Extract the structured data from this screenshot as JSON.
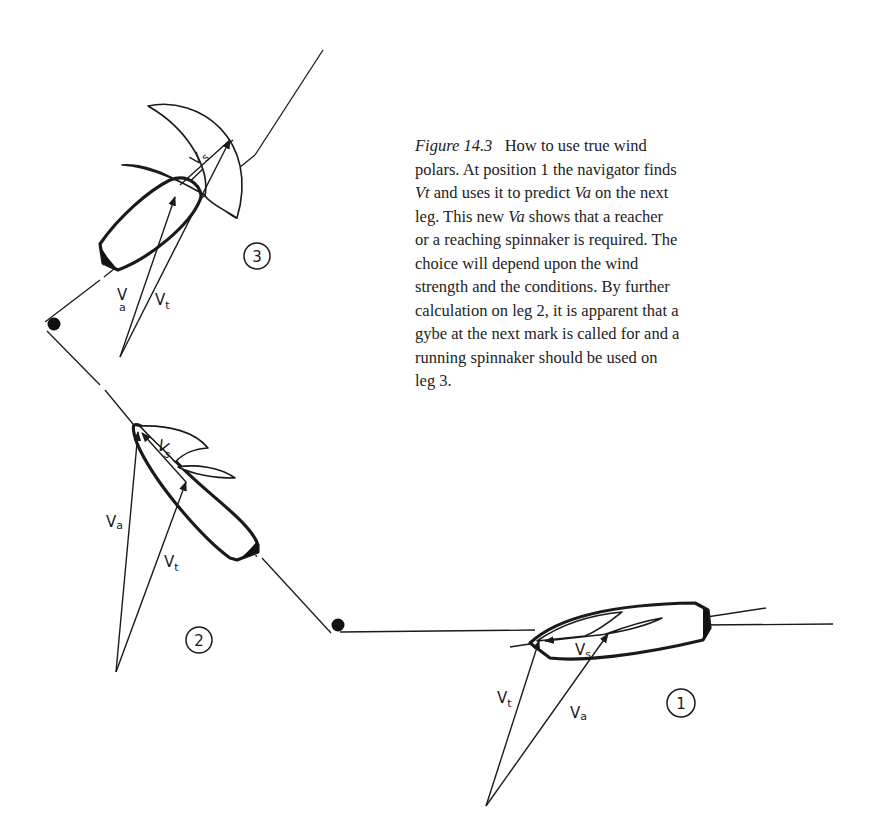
{
  "caption": {
    "figure_label": "Figure  14.3",
    "lines": [
      {
        "pre": "",
        "title_part": "How to use true wind"
      },
      {
        "text": "polars. At position 1 the navigator finds"
      },
      {
        "italic_start": "Vt",
        "rest": " and uses it to predict ",
        "italic_mid": "Va",
        "end": " on the next"
      },
      {
        "start": "leg. This new ",
        "italic_mid": "Va",
        "end": " shows that a reacher"
      },
      {
        "text": "or a reaching spinnaker is required. The"
      },
      {
        "text": "choice will depend upon the wind"
      },
      {
        "text": "strength and the conditions. By further"
      },
      {
        "text": "calculation on leg 2, it is apparent that a"
      },
      {
        "text": "gybe at the next mark is called for and a"
      },
      {
        "text": "running spinnaker should be used on"
      },
      {
        "text": "leg 3."
      }
    ]
  },
  "diagram": {
    "positions": [
      {
        "id": "1",
        "label": "1",
        "vectors": {
          "true_wind": {
            "main": "V",
            "sub": "t"
          },
          "apparent_wind": {
            "main": "V",
            "sub": "a"
          },
          "boat_speed": {
            "main": "V",
            "sub": "s"
          }
        }
      },
      {
        "id": "2",
        "label": "2",
        "vectors": {
          "true_wind": {
            "main": "V",
            "sub": "t"
          },
          "apparent_wind": {
            "main": "V",
            "sub": "a"
          },
          "boat_speed": {
            "main": "V",
            "sub": "s"
          }
        }
      },
      {
        "id": "3",
        "label": "3",
        "vectors": {
          "true_wind": {
            "main": "V",
            "sub": "t"
          },
          "apparent_wind": {
            "main": "V",
            "sub": "a"
          },
          "boat_speed": {
            "main": "V",
            "sub": "s"
          }
        }
      }
    ],
    "marks": [
      "mark-a",
      "mark-b"
    ],
    "colors": {
      "ink": "#1a1a1a",
      "background": "#ffffff"
    }
  }
}
